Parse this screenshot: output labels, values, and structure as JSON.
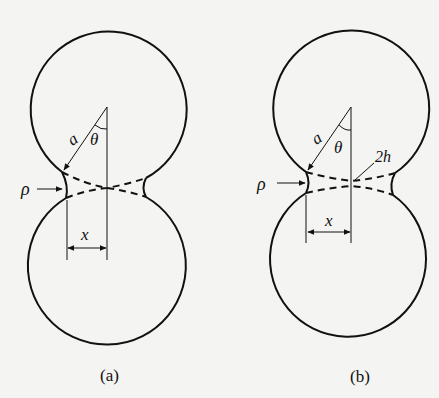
{
  "figure": {
    "panels": [
      {
        "id": "a",
        "caption": "(a)",
        "labels": {
          "radius": "a",
          "angle": "θ",
          "neck_radius": "ρ",
          "neck_half_width": "x"
        }
      },
      {
        "id": "b",
        "caption": "(b)",
        "labels": {
          "radius": "a",
          "angle": "θ",
          "neck_radius": "ρ",
          "neck_half_width": "x",
          "gap": "2h"
        }
      }
    ]
  }
}
